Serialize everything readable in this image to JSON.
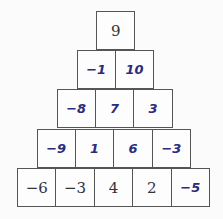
{
  "pyramid": {
    "rows": [
      [
        {
          "value": "9",
          "type": "given"
        }
      ],
      [
        {
          "value": "−1",
          "type": "filled"
        },
        {
          "value": "10",
          "type": "filled"
        }
      ],
      [
        {
          "value": "−8",
          "type": "filled"
        },
        {
          "value": "7",
          "type": "filled"
        },
        {
          "value": "3",
          "type": "filled"
        }
      ],
      [
        {
          "value": "−9",
          "type": "filled"
        },
        {
          "value": "1",
          "type": "filled"
        },
        {
          "value": "6",
          "type": "filled"
        },
        {
          "value": "−3",
          "type": "filled"
        }
      ],
      [
        {
          "value": "−6",
          "type": "given"
        },
        {
          "value": "−3",
          "type": "given"
        },
        {
          "value": "4",
          "type": "given"
        },
        {
          "value": "2",
          "type": "given"
        },
        {
          "value": "−5",
          "type": "filled"
        }
      ]
    ],
    "colors": {
      "given_text": "#333333",
      "filled_text": "#2b2d7c",
      "border": "#555555"
    }
  }
}
